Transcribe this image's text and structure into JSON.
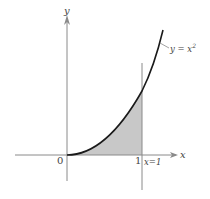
{
  "figure": {
    "curve_label": "y = x",
    "curve_label_exp": "2",
    "y_axis_label": "y",
    "x_axis_label": "x",
    "origin_label": "0",
    "x_tick_label": "1",
    "vertical_line_label": "x=1"
  },
  "colors": {
    "curve": "#1a1a1a",
    "axis": "#8a8a8a",
    "shade": "#c8c8c8",
    "text": "#444444"
  }
}
